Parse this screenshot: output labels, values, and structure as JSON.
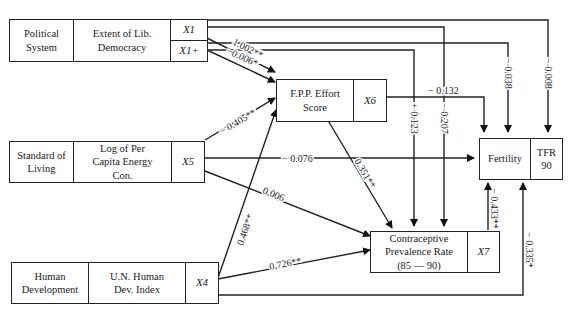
{
  "nodes": {
    "political": {
      "category": "Political System",
      "measure": "Extent of Lib. Democracy",
      "var1": "X1",
      "var2": "X1+"
    },
    "fpp": {
      "label": "F.P.P. Effort Score",
      "var": "X6"
    },
    "standard": {
      "category": "Standard of Living",
      "measure": "Log of Per Capita Energy Con.",
      "var": "X5"
    },
    "fertility": {
      "label": "Fertility",
      "measure": "TFR 90"
    },
    "human": {
      "category": "Human Development",
      "measure": "U.N. Human Dev. Index",
      "var": "X4"
    },
    "cpr": {
      "label": "Contraceptive Prevalence Rate (85 — 90)",
      "var": "X7"
    }
  },
  "paths": [
    {
      "from": "X1",
      "to": "X6",
      "coef": "1.002**"
    },
    {
      "from": "X1+",
      "to": "X6",
      "coef": "−0.006*"
    },
    {
      "from": "X5",
      "to": "X6",
      "coef": "− 0.405**"
    },
    {
      "from": "X4",
      "to": "X6",
      "coef": "0.468**"
    },
    {
      "from": "X6",
      "to": "Fertility",
      "coef": "− 0.132"
    },
    {
      "from": "X6",
      "to": "X7",
      "coef": "0.351**"
    },
    {
      "from": "X5",
      "to": "Fertility",
      "coef": "− 0.076"
    },
    {
      "from": "X5",
      "to": "X7",
      "coef": "0.006"
    },
    {
      "from": "X4",
      "to": "X7",
      "coef": "0.726**"
    },
    {
      "from": "X1+",
      "to": "X7",
      "coef": "+ 0.123"
    },
    {
      "from": "X1",
      "to": "X7",
      "coef": "− 0.207"
    },
    {
      "from": "X1+",
      "to": "Fertility",
      "coef": "− 0.038"
    },
    {
      "from": "X1",
      "to": "Fertility",
      "coef": "− 0.008"
    },
    {
      "from": "X7",
      "to": "Fertility",
      "coef": "− 0.433**"
    },
    {
      "from": "X4",
      "to": "Fertility",
      "coef": "− 0.335*"
    }
  ]
}
